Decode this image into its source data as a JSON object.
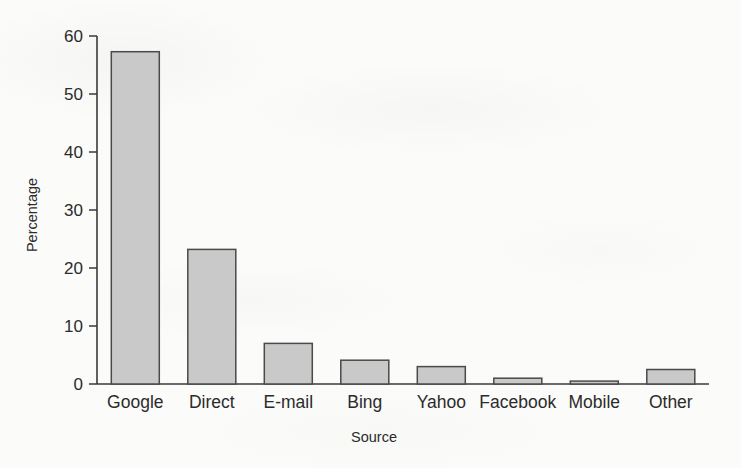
{
  "chart_data": {
    "type": "bar",
    "title": "",
    "xlabel": "Source",
    "ylabel": "Percentage",
    "categories": [
      "Google",
      "Direct",
      "E-mail",
      "Bing",
      "Yahoo",
      "Facebook",
      "Mobile",
      "Other"
    ],
    "values": [
      57.3,
      23.2,
      7.0,
      4.1,
      3.0,
      1.0,
      0.5,
      2.5
    ],
    "ylim": [
      0,
      60
    ],
    "yticks": [
      0,
      10,
      20,
      30,
      40,
      50,
      60
    ],
    "ytick_labels": [
      "0",
      "10",
      "20",
      "30",
      "40",
      "50",
      "60"
    ],
    "grid": false,
    "legend": false,
    "bar_fill_color": "#c9c9c9",
    "bar_edge_color": "#4a4a4a",
    "axis_color": "#3a3a3a",
    "background_color": "#fbfbfa"
  },
  "figure": {
    "ylabel": "Percentage",
    "xlabel": "Source"
  }
}
